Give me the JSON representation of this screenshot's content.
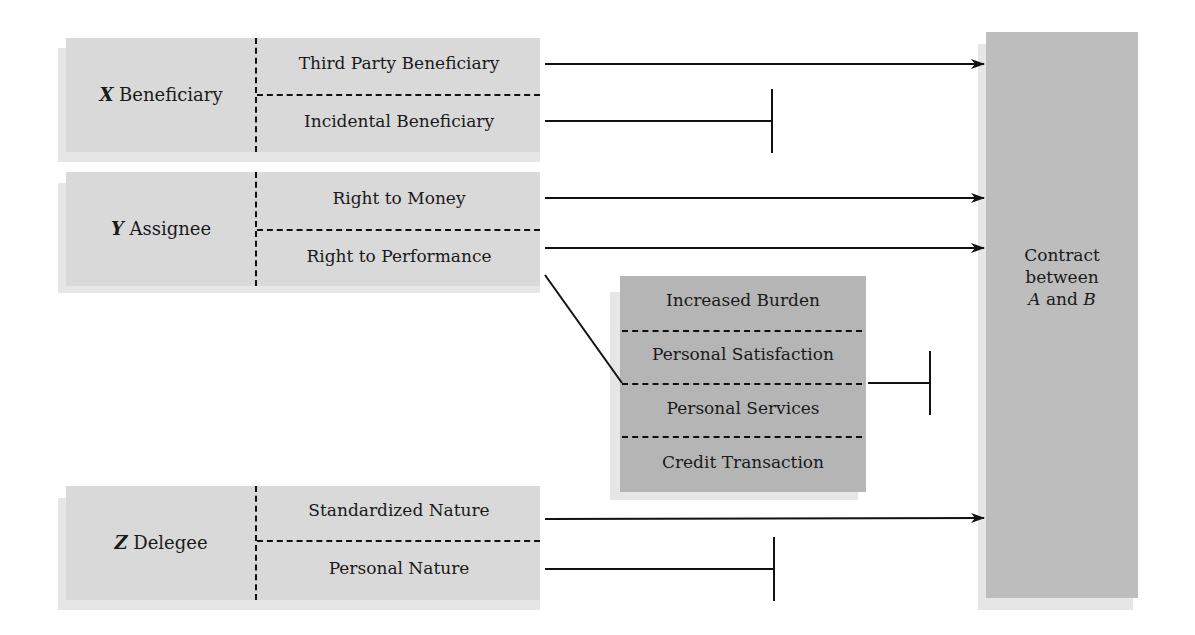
{
  "diagram": {
    "groups": [
      {
        "letter": "X",
        "name": "Beneficiary",
        "items": [
          "Third Party Beneficiary",
          "Incidental Beneficiary"
        ]
      },
      {
        "letter": "Y",
        "name": "Assignee",
        "items": [
          "Right to Money",
          "Right to Performance"
        ]
      },
      {
        "letter": "Z",
        "name": "Delegee",
        "items": [
          "Standardized Nature",
          "Personal Nature"
        ]
      }
    ],
    "exceptions": {
      "items": [
        "Increased Burden",
        "Personal Satisfaction",
        "Personal Services",
        "Credit Transaction"
      ]
    },
    "contract": {
      "line1": "Contract",
      "line2": "between",
      "party_a": "A",
      "and_text": "and",
      "party_b": "B"
    },
    "connections": [
      {
        "from": "Third Party Beneficiary",
        "to": "Contract between A and B",
        "type": "arrow"
      },
      {
        "from": "Incidental Beneficiary",
        "type": "blocked"
      },
      {
        "from": "Right to Money",
        "to": "Contract between A and B",
        "type": "arrow"
      },
      {
        "from": "Right to Performance",
        "to": "Contract between A and B",
        "type": "arrow"
      },
      {
        "from": "Right to Performance",
        "to": "Exceptions",
        "type": "line"
      },
      {
        "from": "Exceptions",
        "type": "blocked"
      },
      {
        "from": "Standardized Nature",
        "to": "Contract between A and B",
        "type": "arrow"
      },
      {
        "from": "Personal Nature",
        "type": "blocked"
      }
    ],
    "colors": {
      "light_box": "#d9d9d9",
      "shadow": "#e6e6e6",
      "exceptions_box": "#b5b5b5",
      "contract_box": "#bdbdbd",
      "line": "#111111"
    }
  }
}
